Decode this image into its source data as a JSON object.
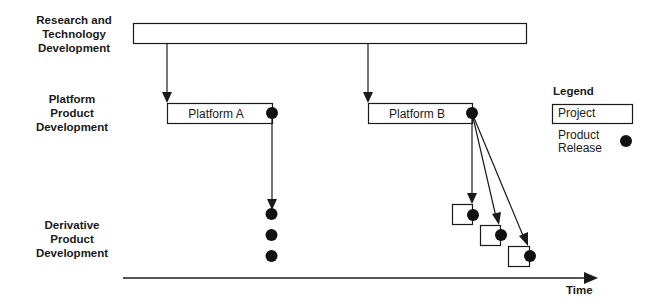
{
  "rows": [
    {
      "label_lines": [
        "Research and",
        "Technology",
        "Development"
      ]
    },
    {
      "label_lines": [
        "Platform",
        "Product",
        "Development"
      ]
    },
    {
      "label_lines": [
        "Derivative",
        "Product",
        "Development"
      ]
    }
  ],
  "projects": {
    "research_bar": {
      "label": ""
    },
    "platform_a": {
      "label": "Platform A"
    },
    "platform_b": {
      "label": "Platform B"
    }
  },
  "derivatives": {
    "platform_a_releases": 3,
    "platform_b_projects": 3
  },
  "legend": {
    "title": "Legend",
    "project_label": "Project",
    "release_label_lines": [
      "Product",
      "Release"
    ]
  },
  "axis": {
    "label": "Time"
  },
  "colors": {
    "line": "#1a1a1a",
    "dot": "#111111",
    "background": "#ffffff"
  }
}
